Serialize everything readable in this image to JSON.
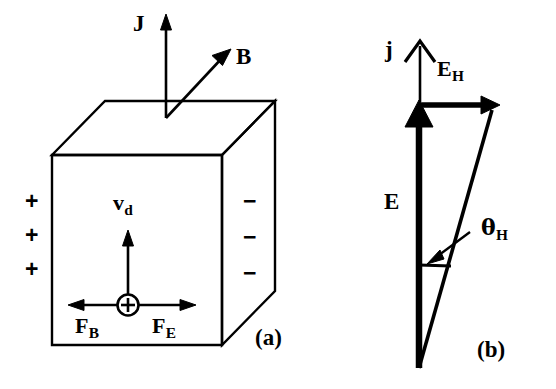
{
  "figure": {
    "background_color": "#ffffff",
    "stroke_color": "#000000",
    "width": 556,
    "height": 389
  },
  "panel_a": {
    "tag": "(a)",
    "labels": {
      "current_density": "J",
      "magnetic_field": "B",
      "drift_velocity": "v",
      "drift_velocity_sub": "d",
      "magnetic_force": "F",
      "magnetic_force_sub": "B",
      "electric_force": "F",
      "electric_force_sub": "E",
      "carrier_sign": "+"
    },
    "left_face_charges": [
      "+",
      "+",
      "+"
    ],
    "right_face_charges": [
      "−",
      "−",
      "−"
    ],
    "arrows": [
      {
        "name": "J",
        "direction": "up",
        "style": "thin"
      },
      {
        "name": "B",
        "direction": "up-right-diagonal",
        "style": "thin"
      },
      {
        "name": "v_d",
        "direction": "up",
        "style": "thin"
      },
      {
        "name": "F_B",
        "direction": "left",
        "style": "thin"
      },
      {
        "name": "F_E",
        "direction": "right",
        "style": "thin"
      }
    ]
  },
  "panel_b": {
    "tag": "(b)",
    "labels": {
      "current_density": "j",
      "electric_field": "E",
      "hall_field": "E",
      "hall_field_sub": "H",
      "hall_angle": "θ",
      "hall_angle_sub": "H"
    },
    "arrows": [
      {
        "name": "j",
        "direction": "up",
        "style": "thin"
      },
      {
        "name": "E",
        "direction": "up",
        "style": "thick"
      },
      {
        "name": "E_H",
        "direction": "right",
        "style": "thick"
      },
      {
        "name": "resultant",
        "direction": "up-right-diagonal",
        "style": "thick"
      }
    ]
  }
}
